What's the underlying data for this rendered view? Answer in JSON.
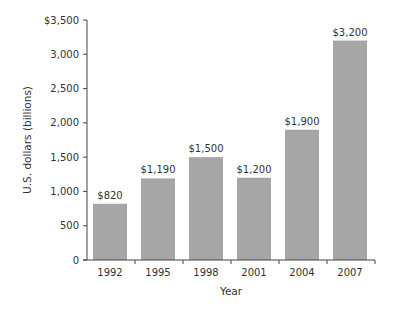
{
  "chart_data": {
    "type": "bar",
    "title": "",
    "xlabel": "Year",
    "ylabel": "U.S. dollars (billions)",
    "categories": [
      "1992",
      "1995",
      "1998",
      "2001",
      "2004",
      "2007"
    ],
    "values": [
      820,
      1190,
      1500,
      1200,
      1900,
      3200
    ],
    "value_labels": [
      "$820",
      "$1,190",
      "$1,500",
      "$1,200",
      "$1,900",
      "$3,200"
    ],
    "ylim": [
      0,
      3500
    ],
    "yticks": [
      0,
      500,
      1000,
      1500,
      2000,
      2500,
      3000,
      3500
    ],
    "ytick_labels": [
      "0",
      "500",
      "1,000",
      "1,500",
      "2,000",
      "2,500",
      "3,000",
      "$3,500"
    ],
    "grid": false,
    "legend": null,
    "bar_color": "#a6a6a6"
  }
}
